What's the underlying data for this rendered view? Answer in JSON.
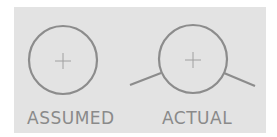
{
  "diagram": {
    "panel_color": "#e3e3e3",
    "stroke_color": "#8c8c8c",
    "items": [
      {
        "label": "ASSUMED",
        "shape": "circle-with-crosshair"
      },
      {
        "label": "ACTUAL",
        "shape": "circle-with-crosshair-and-tangent-lines"
      }
    ]
  }
}
